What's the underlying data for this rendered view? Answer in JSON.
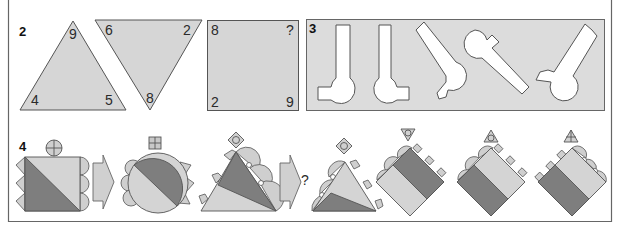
{
  "colors": {
    "light_gray": "#d4d4d4",
    "mid_gray": "#c0c0c0",
    "dark_gray": "#7e7e7e",
    "panel_gray": "#dcdcdc",
    "outline": "#555555",
    "white": "#ffffff"
  },
  "puzzle2": {
    "label": "2",
    "triangle_up": {
      "top": "9",
      "bottom_left": "4",
      "bottom_right": "5"
    },
    "triangle_down": {
      "top_left": "6",
      "top_right": "2",
      "bottom": "8"
    },
    "square": {
      "top_left": "8",
      "top_right": "?",
      "bottom_left": "2",
      "bottom_right": "9"
    }
  },
  "puzzle3": {
    "label": "3",
    "shapes_count": 5
  },
  "puzzle4": {
    "label": "4",
    "sequence_question": "?",
    "sequence": [
      {
        "shape": "square",
        "top_symbol": "circle-cross"
      },
      {
        "shape": "circle",
        "top_symbol": "square-cross"
      },
      {
        "shape": "triangle",
        "top_symbol": "diamond-circle"
      }
    ],
    "options": [
      {
        "shape": "triangle",
        "top_symbol": "diamond-circle"
      },
      {
        "shape": "diamond",
        "top_symbol": "triangle-down-circle"
      },
      {
        "shape": "diamond",
        "top_symbol": "triangle-up-circle"
      },
      {
        "shape": "diamond",
        "top_symbol": "triangle-up-cross"
      }
    ]
  }
}
